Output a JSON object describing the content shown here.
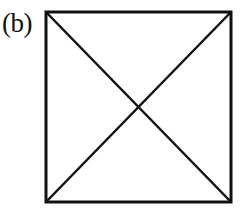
{
  "figure": {
    "label": "(b)",
    "shape": "square-with-diagonals",
    "stroke_color": "#111111",
    "background_color": "#ffffff",
    "square": {
      "x1": 46,
      "y1": 12,
      "x2": 231,
      "y2": 202
    },
    "diagonals": [
      {
        "from": "top-left",
        "to": "bottom-right"
      },
      {
        "from": "top-right",
        "to": "bottom-left"
      }
    ]
  }
}
